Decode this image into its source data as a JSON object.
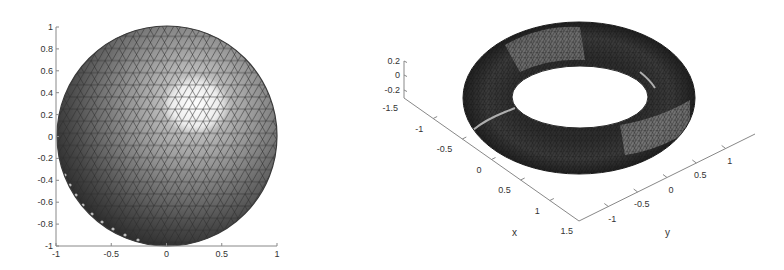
{
  "chart_data": [
    {
      "type": "surface",
      "title": "",
      "description": "Triangulated unit sphere mesh, viewed from top (2D view)",
      "xlabel": "",
      "ylabel": "",
      "xlim": [
        -1,
        1
      ],
      "ylim": [
        -1,
        1
      ],
      "xticks": [
        "-1",
        "-0.5",
        "0",
        "0.5",
        "1"
      ],
      "yticks": [
        "1",
        "0.8",
        "0.6",
        "0.4",
        "0.2",
        "0",
        "-0.2",
        "-0.4",
        "-0.6",
        "-0.8",
        "-1"
      ],
      "grid": false,
      "shape": "sphere",
      "radius": 1,
      "highlight_center": [
        0.25,
        0.3
      ]
    },
    {
      "type": "surface",
      "title": "",
      "description": "Triangulated torus mesh, 3D view",
      "xlabel": "x",
      "ylabel": "y",
      "zlabel": "",
      "xlim": [
        -1.5,
        1.5
      ],
      "ylim": [
        -1.5,
        1.5
      ],
      "zlim": [
        -0.2,
        0.2
      ],
      "xticks": [
        "-1.5",
        "-1",
        "-0.5",
        "0",
        "0.5",
        "1",
        "1.5"
      ],
      "yticks": [
        "-1",
        "-0.5",
        "0",
        "0.5",
        "1"
      ],
      "zticks": [
        "0.2",
        "0",
        "-0.2"
      ],
      "grid": false,
      "shape": "torus"
    }
  ],
  "left_plot": {
    "yticks": [
      "1",
      "0.8",
      "0.6",
      "0.4",
      "0.2",
      "0",
      "-0.2",
      "-0.4",
      "-0.6",
      "-0.8",
      "-1"
    ],
    "xticks": [
      "-1",
      "-0.5",
      "0",
      "0.5",
      "1"
    ]
  },
  "right_plot": {
    "zticks": [
      "0.2",
      "0",
      "-0.2"
    ],
    "xticks": [
      "-1.5",
      "-1",
      "-0.5",
      "0",
      "0.5",
      "1",
      "1.5"
    ],
    "yticks": [
      "-1",
      "-0.5",
      "0",
      "0.5",
      "1"
    ],
    "xlabel": "x",
    "ylabel": "y"
  }
}
